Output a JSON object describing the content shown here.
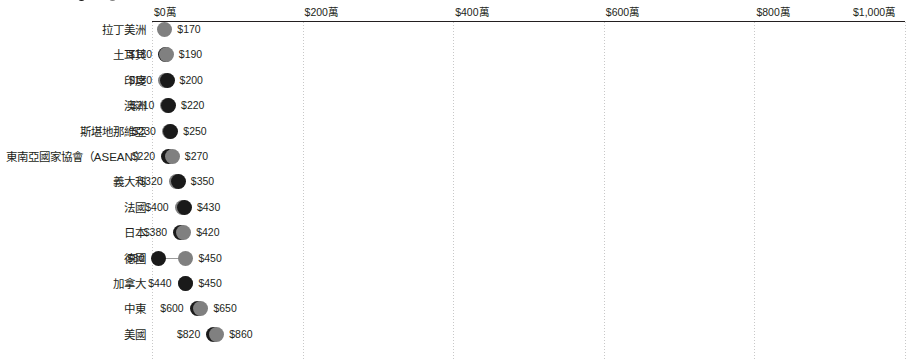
{
  "chart_data": {
    "type": "scatter",
    "subtype": "dumbbell",
    "title": "",
    "xlabel": "",
    "ylabel": "",
    "xlim": [
      0,
      10000000
    ],
    "grid": true,
    "legend_position": "top",
    "currency_prefix": "$",
    "x_ticks": [
      {
        "value": 0,
        "label": "$0萬"
      },
      {
        "value": 2000000,
        "label": "$200萬"
      },
      {
        "value": 4000000,
        "label": "$400萬"
      },
      {
        "value": 6000000,
        "label": "$600萬"
      },
      {
        "value": 8000000,
        "label": "$800萬"
      },
      {
        "value": 10000000,
        "label": "$1,000萬"
      }
    ],
    "series": [
      {
        "name": "dark",
        "color": "#1a1a1a"
      },
      {
        "name": "gray",
        "color": "#808080"
      }
    ],
    "categories": [
      "拉丁美洲",
      "土耳其",
      "印度",
      "澳洲",
      "斯堪地那維亞",
      "東南亞國家協會（ASEAN'）",
      "義大利",
      "法國",
      "日本",
      "德國",
      "加拿大",
      "中東",
      "美國"
    ],
    "rows": [
      {
        "category": "拉丁美洲",
        "points": [
          {
            "series": "gray",
            "value": 170000,
            "label": "$170",
            "label_side": "right"
          }
        ],
        "connector": false
      },
      {
        "category": "土耳其",
        "points": [
          {
            "series": "dark",
            "value": 180000,
            "label": "$180",
            "label_side": "left"
          },
          {
            "series": "gray",
            "value": 190000,
            "label": "$190",
            "label_side": "right"
          }
        ],
        "connector": false
      },
      {
        "category": "印度",
        "points": [
          {
            "series": "gray",
            "value": 180000,
            "label": "$180",
            "label_side": "left"
          },
          {
            "series": "dark",
            "value": 200000,
            "label": "$200",
            "label_side": "right"
          }
        ],
        "connector": false
      },
      {
        "category": "澳洲",
        "points": [
          {
            "series": "gray",
            "value": 210000,
            "label": "$210",
            "label_side": "left"
          },
          {
            "series": "dark",
            "value": 220000,
            "label": "$220",
            "label_side": "right"
          }
        ],
        "connector": false
      },
      {
        "category": "斯堪地那維亞",
        "points": [
          {
            "series": "gray",
            "value": 230000,
            "label": "$230",
            "label_side": "left"
          },
          {
            "series": "dark",
            "value": 250000,
            "label": "$250",
            "label_side": "right"
          }
        ],
        "connector": false
      },
      {
        "category": "東南亞國家協會（ASEAN'）",
        "points": [
          {
            "series": "dark",
            "value": 220000,
            "label": "$220",
            "label_side": "left"
          },
          {
            "series": "gray",
            "value": 270000,
            "label": "$270",
            "label_side": "right"
          }
        ],
        "connector": true
      },
      {
        "category": "義大利",
        "points": [
          {
            "series": "gray",
            "value": 320000,
            "label": "$320",
            "label_side": "left"
          },
          {
            "series": "dark",
            "value": 350000,
            "label": "$350",
            "label_side": "right"
          }
        ],
        "connector": true
      },
      {
        "category": "法國",
        "points": [
          {
            "series": "gray",
            "value": 400000,
            "label": "$400",
            "label_side": "left"
          },
          {
            "series": "dark",
            "value": 430000,
            "label": "$430",
            "label_side": "right"
          }
        ],
        "connector": false
      },
      {
        "category": "日本",
        "points": [
          {
            "series": "dark",
            "value": 380000,
            "label": "$380",
            "label_side": "left"
          },
          {
            "series": "gray",
            "value": 420000,
            "label": "$420",
            "label_side": "right"
          }
        ],
        "connector": true
      },
      {
        "category": "德國",
        "points": [
          {
            "series": "dark",
            "value": 80000,
            "label": "$80",
            "label_side": "left"
          },
          {
            "series": "gray",
            "value": 450000,
            "label": "$450",
            "label_side": "right"
          }
        ],
        "connector": true
      },
      {
        "category": "加拿大",
        "points": [
          {
            "series": "gray",
            "value": 440000,
            "label": "$440",
            "label_side": "left"
          },
          {
            "series": "dark",
            "value": 450000,
            "label": "$450",
            "label_side": "right"
          }
        ],
        "connector": false
      },
      {
        "category": "中東",
        "points": [
          {
            "series": "dark",
            "value": 600000,
            "label": "$600",
            "label_side": "left"
          },
          {
            "series": "gray",
            "value": 650000,
            "label": "$650",
            "label_side": "right"
          }
        ],
        "connector": true
      },
      {
        "category": "美國",
        "points": [
          {
            "series": "dark",
            "value": 820000,
            "label": "$820",
            "label_side": "left"
          },
          {
            "series": "gray",
            "value": 860000,
            "label": "$860",
            "label_side": "right"
          }
        ],
        "connector": true
      }
    ]
  },
  "legend_strip": {
    "clipped": true,
    "items": [
      {
        "series": "dark",
        "label": ""
      },
      {
        "series": "gray",
        "label": ""
      }
    ]
  }
}
